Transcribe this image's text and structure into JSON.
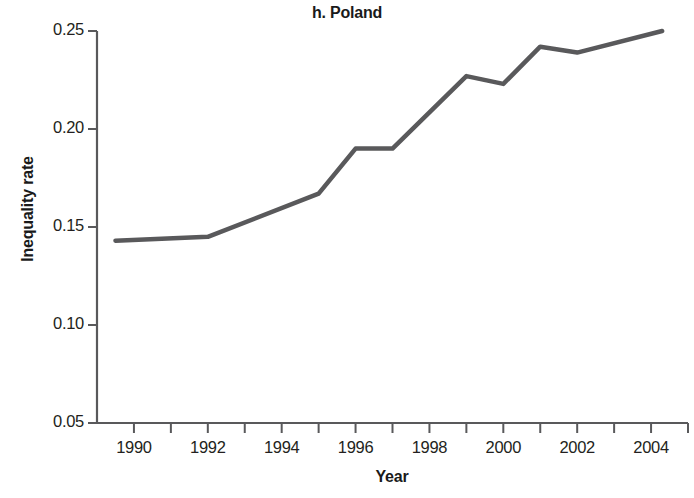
{
  "chart_data": {
    "type": "line",
    "title": "h. Poland",
    "xlabel": "Year",
    "ylabel": "Inequality rate",
    "grid": false,
    "legend": "none",
    "xlim": [
      1989,
      2005
    ],
    "ylim": [
      0.05,
      0.25
    ],
    "x_ticks_major": [
      1990,
      1992,
      1994,
      1996,
      1998,
      2000,
      2002,
      2004
    ],
    "x_tick_labels": [
      "1990",
      "1992",
      "1994",
      "1996",
      "1998",
      "2000",
      "2002",
      "2004"
    ],
    "x_ticks_minor": [
      1991,
      1993,
      1995,
      1997,
      1999,
      2001,
      2003,
      2005
    ],
    "y_ticks": [
      0.05,
      0.1,
      0.15,
      0.2,
      0.25
    ],
    "y_tick_labels": [
      "0.05",
      "0.10",
      "0.15",
      "0.20",
      "0.25"
    ],
    "series": [
      {
        "name": "Inequality rate",
        "color": "#59595b",
        "x": [
          1989.5,
          1992,
          1995,
          1996,
          1997,
          1999,
          2000,
          2001,
          2002,
          2004.3
        ],
        "values": [
          0.143,
          0.145,
          0.167,
          0.19,
          0.19,
          0.227,
          0.223,
          0.242,
          0.239,
          0.25
        ]
      }
    ]
  },
  "axes": {
    "line_color": "#59595b",
    "text_color": "#231f20"
  }
}
